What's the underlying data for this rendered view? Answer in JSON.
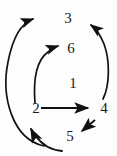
{
  "diagram": {
    "kind": "directed-cycle-graph",
    "background_color": "#fdfdfd",
    "stroke_color": "#111111",
    "label_color": "#1a1a1a",
    "nodes": [
      {
        "id": "n1",
        "label": "1",
        "x": 66,
        "y": 76
      },
      {
        "id": "n2",
        "label": "2",
        "x": 29,
        "y": 101
      },
      {
        "id": "n3",
        "label": "3",
        "x": 61,
        "y": 11
      },
      {
        "id": "n4",
        "label": "4",
        "x": 97,
        "y": 101
      },
      {
        "id": "n5",
        "label": "5",
        "x": 63,
        "y": 129
      },
      {
        "id": "n6",
        "label": "6",
        "x": 64,
        "y": 41
      }
    ],
    "edges": [
      {
        "id": "e-2-3",
        "from": "2",
        "to": "3",
        "style": "curved-left-outer"
      },
      {
        "id": "e-4-3",
        "from": "4",
        "to": "3",
        "style": "curved-right-outer"
      },
      {
        "id": "e-2-6",
        "from": "2",
        "to": "6",
        "style": "curved-inner"
      },
      {
        "id": "e-2-4",
        "from": "2",
        "to": "4",
        "style": "straight-horizontal"
      },
      {
        "id": "e-4-5",
        "from": "4",
        "to": "5",
        "style": "short-diagonal"
      },
      {
        "id": "e-5-2",
        "from": "5",
        "to": "2",
        "style": "curved-bottom"
      }
    ]
  }
}
